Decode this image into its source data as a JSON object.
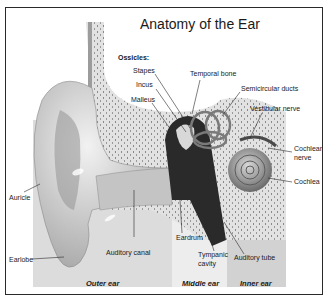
{
  "title": "Anatomy of the Ear",
  "ossicles_heading": "Ossicles:",
  "labels": {
    "stapes": "Stapes",
    "incus": "Incus",
    "malleus": "Malleus",
    "temporal_bone": "Temporal bone",
    "semicircular_ducts": "Semicircular ducts",
    "vestibular_nerve": "Vestibular nerve",
    "cochlear_nerve_1": "Cochlear",
    "cochlear_nerve_2": "nerve",
    "cochlea": "Cochlea",
    "auricle": "Auricle",
    "earlobe": "Earlobe",
    "auditory_canal": "Auditory canal",
    "eardrum": "Eardrum",
    "tympanic_cavity_1": "Tympanic",
    "tympanic_cavity_2": "cavity",
    "auditory_tube": "Auditory tube"
  },
  "regions": {
    "outer": "Outer ear",
    "middle": "Middle ear",
    "inner": "Inner ear"
  },
  "colors": {
    "outer_band": "#d9d9d9",
    "middle_band": "#ececec",
    "inner_band": "#cfcfcf",
    "bone": "#e4e4e4",
    "skin": "#c8c8c8",
    "dark": "#1e1e1e"
  }
}
